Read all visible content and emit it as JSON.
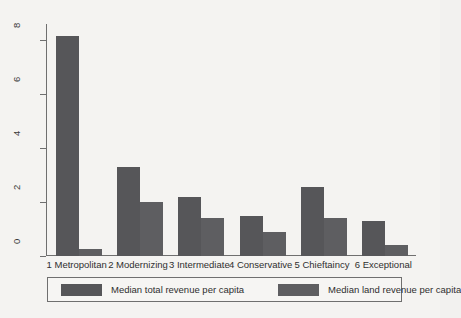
{
  "chart_data": {
    "type": "bar",
    "title": "",
    "subtitle": "",
    "xlabel": "",
    "ylabel": "",
    "grid": false,
    "legend_position": "bottom",
    "ylim": [
      0,
      8.6
    ],
    "yticks": [
      0,
      2,
      4,
      6,
      8
    ],
    "ytick_labels": [
      "0",
      "2",
      "4",
      "6",
      "8"
    ],
    "categories": [
      "1 Metropolitan",
      "2 Modernizing",
      "3 Intermediate",
      "4 Conservative",
      "5 Chieftaincy",
      "6 Exceptional"
    ],
    "series": [
      {
        "name": "Median total revenue per capita",
        "color": "#565659",
        "values": [
          8.15,
          3.3,
          2.2,
          1.5,
          2.55,
          1.3
        ]
      },
      {
        "name": "Median land revenue per capita",
        "color": "#5e5e61",
        "values": [
          0.25,
          2.0,
          1.4,
          0.9,
          1.4,
          0.4
        ]
      }
    ]
  },
  "legend": {
    "entries": [
      {
        "label": "Median total revenue per capita"
      },
      {
        "label": "Median land revenue per capita"
      }
    ]
  },
  "colors": {
    "background": "#f4f3f1",
    "axis": "#6f6f6f",
    "text": "#2f2f2f",
    "series_total": "#565659",
    "series_land": "#5e5e61"
  }
}
